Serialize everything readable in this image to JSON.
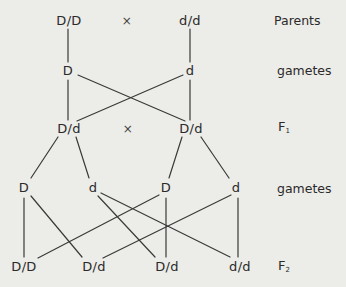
{
  "diagram": {
    "row_labels": {
      "parents": "Parents",
      "gametes_1": "gametes",
      "f1": {
        "base": "F",
        "sub": "1"
      },
      "gametes_2": "gametes",
      "f2": {
        "base": "F",
        "sub": "2"
      }
    },
    "parents": {
      "left": "D/D",
      "cross": "×",
      "right": "d/d"
    },
    "gametes_1": [
      "D",
      "d"
    ],
    "f1": {
      "left": "D/d",
      "cross": "×",
      "right": "D/d"
    },
    "gametes_2": [
      "D",
      "d",
      "D",
      "d"
    ],
    "f2": [
      "D/D",
      "D/d",
      "D/d",
      "d/d"
    ],
    "connections": [
      {
        "from": "parents.left",
        "to": "gametes_1.0"
      },
      {
        "from": "parents.right",
        "to": "gametes_1.1"
      },
      {
        "from": "gametes_1.0",
        "to": "f1.left"
      },
      {
        "from": "gametes_1.0",
        "to": "f1.right"
      },
      {
        "from": "gametes_1.1",
        "to": "f1.left"
      },
      {
        "from": "gametes_1.1",
        "to": "f1.right"
      },
      {
        "from": "f1.left",
        "to": "gametes_2.0"
      },
      {
        "from": "f1.left",
        "to": "gametes_2.1"
      },
      {
        "from": "f1.right",
        "to": "gametes_2.2"
      },
      {
        "from": "f1.right",
        "to": "gametes_2.3"
      },
      {
        "from": "gametes_2.0",
        "to": "f2.0"
      },
      {
        "from": "gametes_2.0",
        "to": "f2.1"
      },
      {
        "from": "gametes_2.1",
        "to": "f2.2"
      },
      {
        "from": "gametes_2.1",
        "to": "f2.3"
      },
      {
        "from": "gametes_2.2",
        "to": "f2.0"
      },
      {
        "from": "gametes_2.2",
        "to": "f2.2"
      },
      {
        "from": "gametes_2.3",
        "to": "f2.1"
      },
      {
        "from": "gametes_2.3",
        "to": "f2.3"
      }
    ]
  }
}
